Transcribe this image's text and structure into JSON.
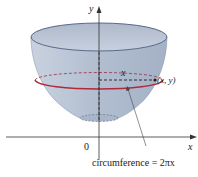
{
  "figure": {
    "axes": {
      "y_label": "y",
      "x_label": "x",
      "origin_label": "0"
    },
    "annotations": {
      "radius_label": "x",
      "point_label": "(x, y)",
      "caption": "circumference = 2πx"
    },
    "colors": {
      "surface": "#b9c4d4",
      "surface_dark": "#9aa8bc",
      "rim": "#5a6a8c",
      "circle": "#b02a3a",
      "axis": "#333333"
    }
  }
}
